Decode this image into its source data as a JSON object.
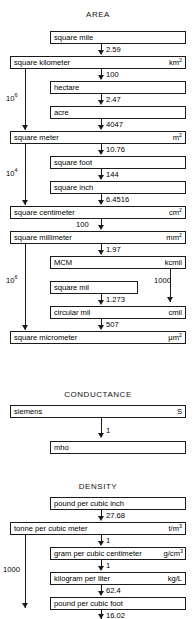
{
  "diagram": {
    "title_area": "AREA",
    "title_conductance": "CONDUCTANCE",
    "title_density": "DENSITY"
  },
  "area": {
    "boxes": [
      {
        "name": "square mile",
        "symbol": "",
        "sup": ""
      },
      {
        "name": "square kilometer",
        "symbol": "km",
        "sup": "2"
      },
      {
        "name": "hectare",
        "symbol": "",
        "sup": ""
      },
      {
        "name": "acre",
        "symbol": "",
        "sup": ""
      },
      {
        "name": "square meter",
        "symbol": "m",
        "sup": "2"
      },
      {
        "name": "square foot",
        "symbol": "",
        "sup": ""
      },
      {
        "name": "square inch",
        "symbol": "",
        "sup": ""
      },
      {
        "name": "square centimeter",
        "symbol": "cm",
        "sup": "2"
      },
      {
        "name": "square millimeter",
        "symbol": "mm",
        "sup": "2"
      },
      {
        "name": "MCM",
        "symbol": "kcmil",
        "sup": ""
      },
      {
        "name": "square mil",
        "symbol": "",
        "sup": ""
      },
      {
        "name": "circular mil",
        "symbol": "cmil",
        "sup": ""
      },
      {
        "name": "square micrometer",
        "symbol": "µm",
        "sup": "2"
      }
    ],
    "factors": {
      "mile_to_km2": "2.59",
      "km2_to_hectare": "100",
      "hectare_to_acre": "2.47",
      "acre_to_m2": "4047",
      "m2_to_sqft": "10.76",
      "sqft_to_sqin": "144",
      "sqin_to_cm2": "6.4516",
      "cm2_to_mm2": "100",
      "mm2_to_mcm": "1.97",
      "sqmil_to_cmil": "1.273",
      "cmil_to_um2": "507",
      "km2_to_m2_base": "10",
      "km2_to_m2_exp": "6",
      "m2_to_cm2_base": "10",
      "m2_to_cm2_exp": "4",
      "mm2_to_um2_base": "10",
      "mm2_to_um2_exp": "6",
      "mcm_to_cmil": "1000"
    }
  },
  "conductance": {
    "boxes": [
      {
        "name": "siemens",
        "symbol": "S",
        "sup": ""
      },
      {
        "name": "mho",
        "symbol": "",
        "sup": ""
      }
    ],
    "factors": {
      "siemens_to_mho": "1"
    }
  },
  "density": {
    "boxes": [
      {
        "name": "pound per cubic inch",
        "symbol": "",
        "sup": ""
      },
      {
        "name": "tonne per cubic meter",
        "symbol": "t/m",
        "sup": "3"
      },
      {
        "name": "gram per cubic centimeter",
        "symbol": "g/cm",
        "sup": "3"
      },
      {
        "name": "kilogram per liter",
        "symbol": "kg/L",
        "sup": ""
      },
      {
        "name": "pound per cubic foot",
        "symbol": "",
        "sup": ""
      }
    ],
    "factors": {
      "lbin3_to_tm3": "27.68",
      "tm3_to_gcm3": "1",
      "gcm3_to_kgl": "1",
      "kgl_to_lbft3": "62.4",
      "lbft3_to_next": "16.02",
      "tm3_bypass": "1000"
    }
  }
}
